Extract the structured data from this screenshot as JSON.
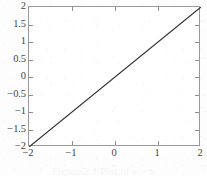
{
  "chart_data": {
    "type": "line",
    "title": "",
    "subtitle": "",
    "xlabel": "",
    "ylabel": "",
    "x": [
      -2,
      2
    ],
    "series": [
      {
        "name": "y = x",
        "values": [
          -2,
          2
        ],
        "color": "#2b2b2b",
        "linewidth": 1,
        "linestyle": "solid"
      }
    ],
    "xlim": [
      -2,
      2
    ],
    "ylim": [
      -2,
      2
    ],
    "xticks": [
      -2,
      -1,
      0,
      1,
      2
    ],
    "yticks": [
      -2,
      -1.5,
      -1,
      -0.5,
      0,
      0.5,
      1,
      1.5,
      2
    ],
    "xticklabels": [
      "−2",
      "−1",
      "0",
      "1",
      "2"
    ],
    "yticklabels": [
      "2",
      "1.5",
      "1",
      "0.5",
      "0",
      "−0.5",
      "−1",
      "−1.5",
      "−2"
    ],
    "grid": false,
    "legend": null,
    "legend_position": "none",
    "annotations": [],
    "box": true,
    "tick_direction": "in"
  },
  "figure": {
    "background_color": "#fdfdfd",
    "plot_background_color": "#ffffff",
    "axis_color": "#9a9a9a",
    "tick_color": "#8e8e8e",
    "label_color": "#454545",
    "line_color": "#2b2b2b"
  },
  "caption": {
    "text": "Figure 2.1  Plot of y = x"
  }
}
